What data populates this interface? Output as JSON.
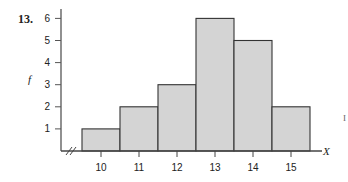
{
  "problem_number": "13.",
  "chart_data": {
    "type": "bar",
    "subtype": "histogram",
    "title": "",
    "xlabel": "X",
    "ylabel": "f",
    "categories": [
      "10",
      "11",
      "12",
      "13",
      "14",
      "15"
    ],
    "values": [
      1,
      2,
      3,
      6,
      5,
      2
    ],
    "yticks": [
      "1",
      "2",
      "3",
      "4",
      "5",
      "6"
    ],
    "ylim": [
      0,
      6
    ],
    "grid": false,
    "axis_break": true,
    "bar_color": "#d4d4d4",
    "edge_color": "#333333"
  },
  "margin_mark": "I"
}
